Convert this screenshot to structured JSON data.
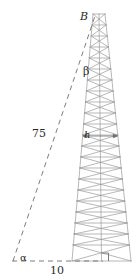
{
  "figure": {
    "type": "geometry-diagram",
    "colors": {
      "tower_line": "#9a9a9a",
      "dashed_line": "#6e6e6e",
      "label_text": "#2a2a2a",
      "background": "#ffffff"
    },
    "labels": {
      "apex": "B",
      "upper_angle": "β",
      "height": "h",
      "hypotenuse": "75",
      "base_angle": "α",
      "base_length": "10"
    },
    "geometry": {
      "tower_top_y": 14,
      "tower_base_y": 261,
      "tower_top_left_x": 93,
      "tower_top_right_x": 105,
      "tower_base_left_x": 72,
      "tower_base_right_x": 131,
      "baseline_left_x": 12,
      "baseline_y": 261,
      "baseline_right_x": 103,
      "hypotenuse_from": [
        13,
        261
      ],
      "hypotenuse_to": [
        95,
        16
      ],
      "right_angle_x": 101,
      "lattice_bays": 22,
      "height_marker_y": 136
    }
  }
}
